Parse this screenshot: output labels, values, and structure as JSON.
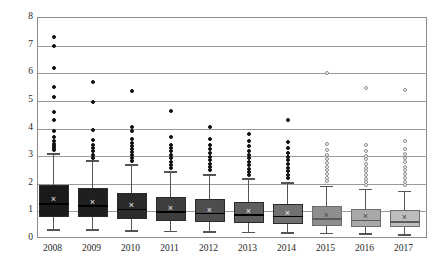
{
  "chart_data": {
    "type": "box",
    "title": "",
    "xlabel": "",
    "ylabel": "",
    "ylim": [
      0,
      8
    ],
    "yticks": [
      0,
      1,
      2,
      3,
      4,
      5,
      6,
      7,
      8
    ],
    "grid": true,
    "legend": "none",
    "categories": [
      "2008",
      "2009",
      "2010",
      "2011",
      "2012",
      "2013",
      "2014",
      "2015",
      "2016",
      "2017"
    ],
    "boxes": [
      {
        "category": "2008",
        "fill": "#1a1a1a",
        "whisker_low": 0.35,
        "q1": 0.8,
        "median": 1.3,
        "mean": 1.45,
        "q3": 1.95,
        "whisker_high": 3.1,
        "outliers": [
          7.3,
          7.0,
          6.2,
          5.5,
          5.15,
          4.6,
          4.3,
          3.9,
          3.7,
          3.55,
          3.45,
          3.35,
          3.28,
          3.22
        ]
      },
      {
        "category": "2009",
        "fill": "#1f1f1f",
        "whisker_low": 0.35,
        "q1": 0.78,
        "median": 1.22,
        "mean": 1.35,
        "q3": 1.85,
        "whisker_high": 2.85,
        "outliers": [
          5.7,
          4.95,
          3.95,
          3.6,
          3.42,
          3.3,
          3.18,
          3.05,
          2.95
        ]
      },
      {
        "category": "2010",
        "fill": "#2b2b2b",
        "whisker_low": 0.32,
        "q1": 0.72,
        "median": 1.1,
        "mean": 1.22,
        "q3": 1.68,
        "whisker_high": 2.7,
        "outliers": [
          5.35,
          4.05,
          3.9,
          3.62,
          3.48,
          3.36,
          3.25,
          3.15,
          3.05,
          2.92,
          2.82
        ]
      },
      {
        "category": "2011",
        "fill": "#3d3d3d",
        "whisker_low": 0.3,
        "q1": 0.65,
        "median": 1.0,
        "mean": 1.12,
        "q3": 1.52,
        "whisker_high": 2.45,
        "outliers": [
          4.65,
          3.68,
          3.42,
          3.3,
          3.18,
          3.05,
          2.92,
          2.8,
          2.68,
          2.58
        ]
      },
      {
        "category": "2012",
        "fill": "#4d4d4d",
        "whisker_low": 0.28,
        "q1": 0.62,
        "median": 0.95,
        "mean": 1.05,
        "q3": 1.45,
        "whisker_high": 2.35,
        "outliers": [
          4.05,
          3.62,
          3.4,
          3.25,
          3.1,
          2.98,
          2.85,
          2.72,
          2.6,
          2.48
        ]
      },
      {
        "category": "2013",
        "fill": "#5e5e5e",
        "whisker_low": 0.26,
        "q1": 0.58,
        "median": 0.9,
        "mean": 1.0,
        "q3": 1.35,
        "whisker_high": 2.2,
        "outliers": [
          3.8,
          3.55,
          3.35,
          3.2,
          3.05,
          2.92,
          2.8,
          2.68,
          2.55,
          2.42,
          2.32
        ]
      },
      {
        "category": "2014",
        "fill": "#707070",
        "whisker_low": 0.25,
        "q1": 0.55,
        "median": 0.85,
        "mean": 0.95,
        "q3": 1.28,
        "whisker_high": 2.05,
        "outliers": [
          4.3,
          3.52,
          3.3,
          3.12,
          2.98,
          2.85,
          2.72,
          2.58,
          2.45,
          2.32,
          2.2
        ]
      },
      {
        "category": "2015",
        "fill": "#8e8e8e",
        "whisker_low": 0.22,
        "q1": 0.48,
        "median": 0.75,
        "mean": 0.88,
        "q3": 1.18,
        "whisker_high": 1.92,
        "outliers": [
          6.0,
          3.45,
          3.22,
          3.05,
          2.9,
          2.75,
          2.62,
          2.48,
          2.35,
          2.22,
          2.1
        ]
      },
      {
        "category": "2016",
        "fill": "#a8a8a8",
        "whisker_low": 0.2,
        "q1": 0.45,
        "median": 0.7,
        "mean": 0.82,
        "q3": 1.1,
        "whisker_high": 1.82,
        "outliers": [
          5.45,
          3.42,
          3.18,
          3.02,
          2.88,
          2.72,
          2.58,
          2.45,
          2.3,
          2.18,
          2.05,
          1.95
        ]
      },
      {
        "category": "2017",
        "fill": "#bdbdbd",
        "whisker_low": 0.18,
        "q1": 0.42,
        "median": 0.65,
        "mean": 0.78,
        "q3": 1.05,
        "whisker_high": 1.75,
        "outliers": [
          5.4,
          3.55,
          3.25,
          3.08,
          2.92,
          2.78,
          2.62,
          2.5,
          2.36,
          2.22,
          2.08,
          1.95
        ]
      }
    ]
  },
  "axes": {
    "y_tick_labels": [
      "0",
      "1",
      "2",
      "3",
      "4",
      "5",
      "6",
      "7",
      "8"
    ],
    "x_tick_labels": [
      "2008",
      "2009",
      "2010",
      "2011",
      "2012",
      "2013",
      "2014",
      "2015",
      "2016",
      "2017"
    ]
  },
  "colors": {
    "frame": "#8c8c8c",
    "gridline": "#9a9a9a",
    "whisker": "#555555",
    "median": "#111111",
    "text": "#262626",
    "background": "#ffffff"
  },
  "markers": {
    "mean_glyph": "×"
  }
}
